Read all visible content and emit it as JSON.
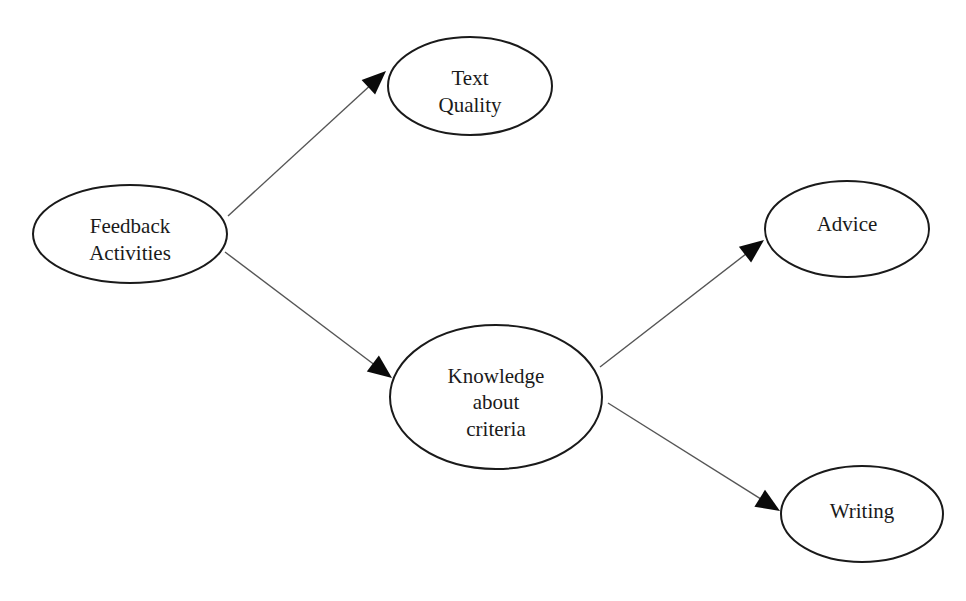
{
  "diagram": {
    "type": "path-model",
    "nodes": [
      {
        "id": "feedback_activities",
        "lines": [
          "Feedback",
          "Activities"
        ]
      },
      {
        "id": "text_quality",
        "lines": [
          "Text",
          "Quality"
        ]
      },
      {
        "id": "knowledge_about_criteria",
        "lines": [
          "Knowledge",
          "about",
          "criteria"
        ]
      },
      {
        "id": "advice",
        "lines": [
          "Advice"
        ]
      },
      {
        "id": "writing",
        "lines": [
          "Writing"
        ]
      }
    ],
    "edges": [
      {
        "from": "feedback_activities",
        "to": "text_quality"
      },
      {
        "from": "feedback_activities",
        "to": "knowledge_about_criteria"
      },
      {
        "from": "knowledge_about_criteria",
        "to": "advice"
      },
      {
        "from": "knowledge_about_criteria",
        "to": "writing"
      }
    ]
  }
}
